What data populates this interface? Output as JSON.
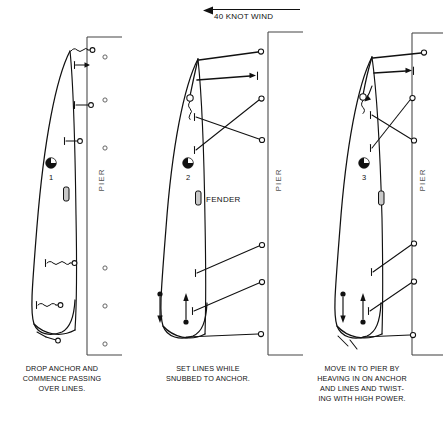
{
  "figure": {
    "wind_label": "40 KNOT WIND",
    "wind_direction": "left",
    "pier_label": "PIER",
    "fender_label": "FENDER",
    "background_color": "#ffffff",
    "ink_color": "#111111",
    "pier_color": "#444444"
  },
  "panels": [
    {
      "number": "1",
      "marker_label": "1",
      "pier_label": "PIER",
      "caption_lines": [
        "DROP ANCHOR AND",
        "COMMENCE PASSING",
        "OVER LINES."
      ],
      "bollard_count": 5,
      "mooring_lines": 5,
      "has_fender": true,
      "fender_label": "",
      "motion_arrows": 1
    },
    {
      "number": "2",
      "marker_label": "2",
      "pier_label": "PIER",
      "caption_lines": [
        "SET LINES WHILE",
        "SNUBBED TO ANCHOR."
      ],
      "bollard_count": 4,
      "mooring_lines": 6,
      "has_fender": true,
      "fender_label": "FENDER",
      "motion_arrows": 3
    },
    {
      "number": "3",
      "marker_label": "3",
      "pier_label": "PIER",
      "caption_lines": [
        "MOVE IN TO PIER BY",
        "HEAVING IN ON ANCHOR",
        "AND LINES AND TWIST-",
        "ING WITH HIGH POWER."
      ],
      "bollard_count": 4,
      "mooring_lines": 6,
      "has_fender": true,
      "fender_label": "",
      "motion_arrows": 3
    }
  ]
}
